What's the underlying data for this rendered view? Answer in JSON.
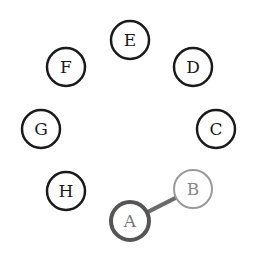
{
  "diagram": {
    "title": "",
    "nodes": [
      {
        "id": "E",
        "label": "E",
        "cx": 130,
        "cy": 40,
        "stroke": "#1a1a1a",
        "fill": "#ffffff",
        "text": "#1a1a1a",
        "sw": 2.5
      },
      {
        "id": "F",
        "label": "F",
        "cx": 66,
        "cy": 67,
        "stroke": "#1a1a1a",
        "fill": "#ffffff",
        "text": "#1a1a1a",
        "sw": 2.5
      },
      {
        "id": "D",
        "label": "D",
        "cx": 193,
        "cy": 67,
        "stroke": "#1a1a1a",
        "fill": "#ffffff",
        "text": "#1a1a1a",
        "sw": 2.5
      },
      {
        "id": "G",
        "label": "G",
        "cx": 41,
        "cy": 129,
        "stroke": "#1a1a1a",
        "fill": "#ffffff",
        "text": "#1a1a1a",
        "sw": 2.5
      },
      {
        "id": "C",
        "label": "C",
        "cx": 216,
        "cy": 129,
        "stroke": "#1a1a1a",
        "fill": "#ffffff",
        "text": "#1a1a1a",
        "sw": 2.5
      },
      {
        "id": "H",
        "label": "H",
        "cx": 66,
        "cy": 191,
        "stroke": "#1a1a1a",
        "fill": "#ffffff",
        "text": "#1a1a1a",
        "sw": 2.5
      },
      {
        "id": "A",
        "label": "A",
        "cx": 130,
        "cy": 221,
        "stroke": "#555555",
        "fill": "#ffffff",
        "text": "#777777",
        "sw": 4
      },
      {
        "id": "B",
        "label": "B",
        "cx": 193,
        "cy": 189,
        "stroke": "#9a9a9a",
        "fill": "#ffffff",
        "text": "#888888",
        "sw": 2
      }
    ],
    "edges": [
      {
        "from": "A",
        "to": "B",
        "color": "#6b6b6b",
        "width": 4
      }
    ],
    "node_radius": 19
  }
}
